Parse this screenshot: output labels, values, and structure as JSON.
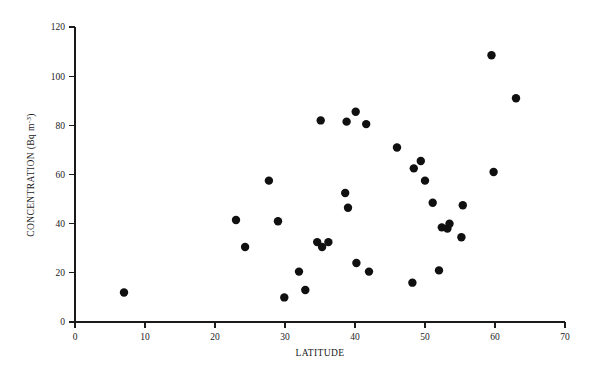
{
  "chart_data": {
    "type": "scatter",
    "title": "",
    "xlabel": "LATITUDE",
    "ylabel_parts": {
      "main": "CONCENTRATION (Bq m",
      "exponent": "-3",
      "tail": ")"
    },
    "ylabel": "CONCENTRATION (Bq m-3)",
    "xlim": [
      0,
      70
    ],
    "ylim": [
      0,
      120
    ],
    "xticks": [
      0,
      10,
      20,
      30,
      40,
      50,
      60,
      70
    ],
    "yticks": [
      0,
      20,
      40,
      60,
      80,
      100,
      120
    ],
    "grid": false,
    "legend": null,
    "marker": {
      "shape": "circle",
      "color": "#101010",
      "radius": 4.2
    },
    "points": [
      {
        "x": 7.0,
        "y": 12.0
      },
      {
        "x": 23.0,
        "y": 41.5
      },
      {
        "x": 24.3,
        "y": 30.5
      },
      {
        "x": 27.7,
        "y": 57.5
      },
      {
        "x": 29.0,
        "y": 41.0
      },
      {
        "x": 29.9,
        "y": 10.0
      },
      {
        "x": 32.0,
        "y": 20.5
      },
      {
        "x": 32.9,
        "y": 13.0
      },
      {
        "x": 34.6,
        "y": 32.5
      },
      {
        "x": 35.1,
        "y": 82.0
      },
      {
        "x": 35.3,
        "y": 30.5
      },
      {
        "x": 36.2,
        "y": 32.5
      },
      {
        "x": 38.6,
        "y": 52.5
      },
      {
        "x": 38.8,
        "y": 81.5
      },
      {
        "x": 39.0,
        "y": 46.5
      },
      {
        "x": 40.1,
        "y": 85.5
      },
      {
        "x": 40.2,
        "y": 24.0
      },
      {
        "x": 41.6,
        "y": 80.5
      },
      {
        "x": 42.0,
        "y": 20.5
      },
      {
        "x": 46.0,
        "y": 71.0
      },
      {
        "x": 48.2,
        "y": 16.0
      },
      {
        "x": 48.4,
        "y": 62.5
      },
      {
        "x": 49.4,
        "y": 65.5
      },
      {
        "x": 50.0,
        "y": 57.5
      },
      {
        "x": 51.1,
        "y": 48.5
      },
      {
        "x": 52.0,
        "y": 21.0
      },
      {
        "x": 52.4,
        "y": 38.5
      },
      {
        "x": 53.2,
        "y": 38.0
      },
      {
        "x": 53.5,
        "y": 40.0
      },
      {
        "x": 55.2,
        "y": 34.5
      },
      {
        "x": 55.4,
        "y": 47.5
      },
      {
        "x": 59.5,
        "y": 108.5
      },
      {
        "x": 59.8,
        "y": 61.0
      },
      {
        "x": 63.0,
        "y": 91.0
      }
    ]
  },
  "axes": {
    "x_tick_labels": [
      "0",
      "10",
      "20",
      "30",
      "40",
      "50",
      "60",
      "70"
    ],
    "y_tick_labels": [
      "0",
      "20",
      "40",
      "60",
      "80",
      "100",
      "120"
    ],
    "x_title": "LATITUDE",
    "y_title_main": "CONCENTRATION (Bq m",
    "y_title_exp": "-3",
    "y_title_tail": ")"
  }
}
